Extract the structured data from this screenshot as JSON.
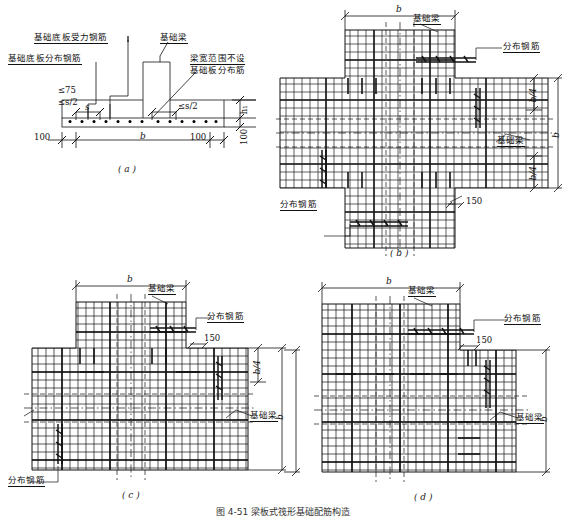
{
  "figure": {
    "caption": "图 4-51  梁板式筏形基础配筋构造",
    "panels": [
      {
        "id": "a",
        "label": "( a )",
        "type": "section",
        "desc": "基础底板配筋剖面"
      },
      {
        "id": "b",
        "label": "( b )",
        "type": "plan-cross",
        "desc": "十字交叉处板底分布筋构造"
      },
      {
        "id": "c",
        "label": "( c )",
        "type": "plan-tee",
        "desc": "丁字交叉处板底分布筋构造"
      },
      {
        "id": "d",
        "label": "( d )",
        "type": "plan-corner",
        "desc": "转角处板底分布筋构造"
      }
    ]
  },
  "panel_a": {
    "letter": "( a )",
    "labels": {
      "main_rebar": "基础底板受力钢筋",
      "dist_rebar": "基础底板分布钢筋",
      "foundation_beam": "基础梁",
      "note_line1": "梁宽范围不设",
      "note_line2": "基础板分布筋"
    },
    "dims": {
      "max75": "≤75",
      "max_s_half_left": "≤s/2",
      "spacing_s": "s",
      "max_s_half_right": "≤s/2",
      "h1": "h₁",
      "edge_left": "100",
      "edge_right": "100",
      "width_b": "b",
      "thickness_100": "100"
    }
  },
  "panel_b": {
    "letter": "( b )",
    "labels": {
      "foundation_beam_top": "基础梁",
      "dist_rebar_top": "分布钢筋",
      "dist_rebar_left": "分布钢筋",
      "foundation_beam_right": "基础梁"
    },
    "dims": {
      "width_b": "b",
      "height_b": "b",
      "quarter_top": "b/4",
      "quarter_bottom": "b/4",
      "lap_150": "150"
    }
  },
  "panel_c": {
    "letter": "( c )",
    "labels": {
      "foundation_beam_top": "基础梁",
      "dist_rebar_top": "分布钢筋",
      "dist_rebar_bottom": "分布钢筋",
      "foundation_beam_right": "基础梁"
    },
    "dims": {
      "width_b": "b",
      "height_b": "b",
      "quarter": "b/4",
      "lap_150": "150"
    }
  },
  "panel_d": {
    "letter": "( d )",
    "labels": {
      "foundation_beam_top": "基础梁",
      "dist_rebar_top": "分布钢筋",
      "foundation_beam_right": "基础梁"
    },
    "dims": {
      "width_b": "b",
      "height_b": "b",
      "lap_150": "150"
    }
  },
  "style": {
    "line_color": "#111111",
    "rebar_color": "#000000",
    "hatch_color": "#555555",
    "bg": "#ffffff"
  }
}
